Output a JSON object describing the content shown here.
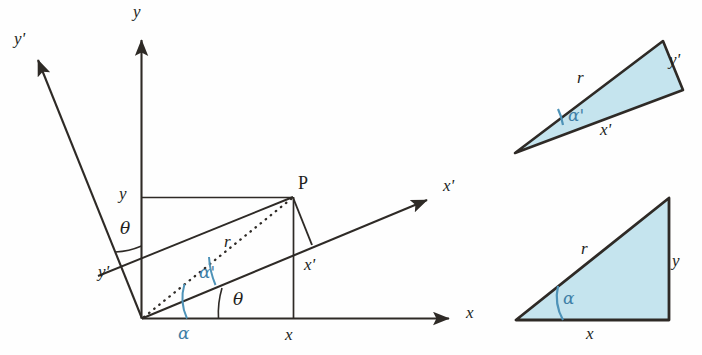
{
  "figure": {
    "colors": {
      "line": "#2e2a26",
      "fill": "#c5e4ee",
      "accent_blue": "#3f7fa6",
      "background": "#fefefe"
    }
  },
  "main_diagram": {
    "name": "rotated-axes-construction",
    "origin": {
      "x": 142,
      "y": 318
    },
    "point_label": "P",
    "axes": [
      {
        "name": "x-axis",
        "label": "x",
        "label_x": 466,
        "label_y": 312,
        "tip": {
          "x": 455,
          "y": 318
        }
      },
      {
        "name": "y-axis",
        "label": "y",
        "label_x": 133,
        "label_y": 8,
        "tip": {
          "x": 141,
          "y": 33
        }
      },
      {
        "name": "x-prime-axis",
        "label": "x'",
        "label_x": 443,
        "label_y": 180,
        "tip": {
          "x": 432,
          "y": 197
        }
      },
      {
        "name": "y-prime-axis",
        "label": "y'",
        "label_x": 14,
        "label_y": 33,
        "tip": {
          "x": 33,
          "y": 54
        }
      }
    ],
    "segment_labels": [
      {
        "name": "y-coordinate-label",
        "text": "y",
        "x": 119,
        "y": 185
      },
      {
        "name": "x-coordinate-label",
        "text": "x",
        "x": 285,
        "y": 327
      },
      {
        "name": "y-prime-coordinate-label",
        "text": "y'",
        "x": 98,
        "y": 264
      },
      {
        "name": "x-prime-coordinate-label",
        "text": "x'",
        "x": 305,
        "y": 257
      },
      {
        "name": "radius-label",
        "text": "r",
        "x": 224,
        "y": 234
      }
    ],
    "angle_labels": [
      {
        "name": "theta-axis-angle",
        "text": "θ",
        "x": 120,
        "y": 221,
        "color": "line"
      },
      {
        "name": "theta-origin-angle",
        "text": "θ",
        "x": 233,
        "y": 292,
        "color": "line"
      },
      {
        "name": "alpha-angle",
        "text": "α",
        "x": 178,
        "y": 326,
        "color": "accent_blue"
      },
      {
        "name": "alpha-prime-angle",
        "text": "α'",
        "x": 199,
        "y": 265,
        "color": "accent_blue"
      }
    ]
  },
  "triangle_top_right": {
    "name": "rotated-frame-triangle",
    "vertices": [
      [
        515,
        153
      ],
      [
        663,
        41
      ],
      [
        683,
        90
      ]
    ],
    "labels": [
      {
        "name": "radius-label",
        "text": "r",
        "x": 577,
        "y": 70
      },
      {
        "name": "alpha-prime-angle",
        "text": "α'",
        "x": 568,
        "y": 108,
        "color": "accent_blue"
      },
      {
        "name": "x-prime-side-label",
        "text": "x'",
        "x": 600,
        "y": 122
      },
      {
        "name": "y-prime-side-label",
        "text": "y'",
        "x": 669,
        "y": 52
      }
    ]
  },
  "triangle_bottom_right": {
    "name": "original-frame-triangle",
    "vertices": [
      [
        516,
        320
      ],
      [
        669,
        320
      ],
      [
        669,
        198
      ]
    ],
    "labels": [
      {
        "name": "radius-label",
        "text": "r",
        "x": 581,
        "y": 241
      },
      {
        "name": "alpha-angle",
        "text": "α",
        "x": 563,
        "y": 291,
        "color": "accent_blue"
      },
      {
        "name": "x-side-label",
        "text": "x",
        "x": 586,
        "y": 326
      },
      {
        "name": "y-side-label",
        "text": "y",
        "x": 672,
        "y": 253
      }
    ]
  }
}
